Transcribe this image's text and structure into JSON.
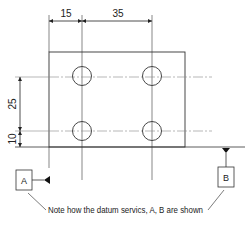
{
  "diagram": {
    "type": "engineering-drawing",
    "dimensions": {
      "top_left": "15",
      "top_right": "35",
      "left_upper": "25",
      "left_lower": "10"
    },
    "datums": {
      "a": "A",
      "b": "B"
    },
    "note": "Note how the datum servics, A, B are shown",
    "colors": {
      "line": "#333333",
      "centerline": "#888888",
      "text": "#222222"
    }
  }
}
